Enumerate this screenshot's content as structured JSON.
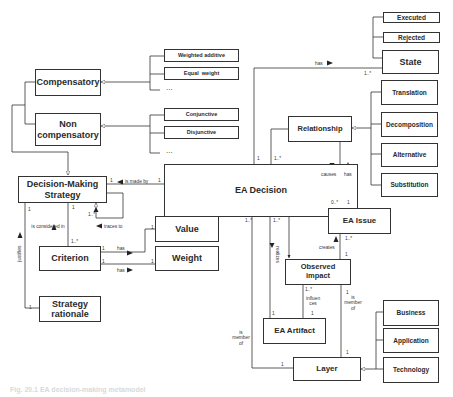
{
  "diagram": {
    "classes": {
      "compensatory": "Compensatory",
      "non_compensatory": "Non compensatory",
      "weighted_additive": "Weighted additive",
      "equal_weight": "Equal  weight",
      "conjunctive": "Conjunctive",
      "disjunctive": "Disjunctive",
      "decision_making_strategy": "Decision-Making Strategy",
      "ea_decision": "EA Decision",
      "value": "Value",
      "weight": "Weight",
      "criterion": "Criterion",
      "strategy_rationale": "Strategy rationale",
      "executed": "Executed",
      "rejected": "Rejected",
      "state": "State",
      "translation": "Translation",
      "decomposition": "Decomposition",
      "alternative": "Alternative",
      "substitution": "Substitution",
      "relationship": "Relationship",
      "ea_issue": "EA Issue",
      "observed_impact": "Observed impact",
      "ea_artifact": "EA Artifact",
      "layer": "Layer",
      "business": "Business",
      "application": "Application",
      "technology": "Technology"
    },
    "ellipsis": "...",
    "associations": {
      "is_made_by": "is made by",
      "traces_to": "traces to",
      "is_considered_in": "is considered in",
      "justifies": "justifies",
      "has_value": "has",
      "has_weight": "has",
      "has_state": "has",
      "causes": "causes",
      "has_issue": "has",
      "creates": "creates",
      "realizes": "realizes",
      "influences": "influen ces",
      "is_member_of_decision": "is member of",
      "is_member_of_impact": "is member of"
    },
    "multiplicities": {
      "one": "1",
      "one_many": "1..*",
      "zero_many": "0..*"
    },
    "caption": "Fig. 20.1  EA decision-making metamodel"
  },
  "colors": {
    "line": "#333333",
    "box_fill": "#ffffff",
    "text": "#2a2a2a"
  }
}
